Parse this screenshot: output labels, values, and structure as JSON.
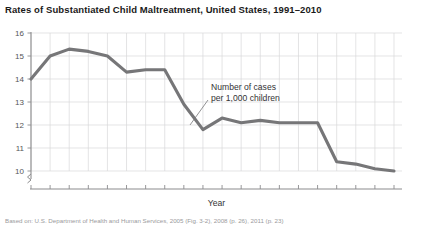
{
  "chart_data": {
    "type": "line",
    "title": "Rates of Substantiated Child Maltreatment, United States, 1991–2010",
    "xlabel": "Year",
    "ylabel": "",
    "annotation": "Number of cases\nper 1,000 children",
    "annotation_line1": "Number of cases",
    "annotation_line2": "per 1,000 children",
    "source": "Based on: U.S. Department of Health and Human Services, 2005 (Fig. 3-2), 2008 (p. 26), 2011 (p. 23)",
    "grid": true,
    "legend_position": "none",
    "axis_break_y": true,
    "axis_break_x": true,
    "xlim": [
      1991,
      2010
    ],
    "ylim": [
      10,
      16
    ],
    "yticks": [
      10,
      11,
      12,
      13,
      14,
      15,
      16
    ],
    "ytick_labels": [
      "10",
      "11",
      "12",
      "13",
      "14",
      "15",
      "16"
    ],
    "xticks": [
      1991,
      1995,
      2000,
      2005,
      2010
    ],
    "xtick_labels": [
      "1991",
      "1995",
      "2000",
      "2005",
      "2010"
    ],
    "x": [
      1991,
      1992,
      1993,
      1994,
      1995,
      1996,
      1997,
      1998,
      1999,
      2000,
      2001,
      2002,
      2003,
      2004,
      2005,
      2006,
      2007,
      2008,
      2009,
      2010
    ],
    "values": [
      14.0,
      15.0,
      15.3,
      15.2,
      15.0,
      14.3,
      14.4,
      14.4,
      12.9,
      11.8,
      12.3,
      12.1,
      12.2,
      12.1,
      12.1,
      12.1,
      10.4,
      10.3,
      10.1,
      10.0
    ],
    "series": [
      {
        "name": "Number of cases per 1,000 children",
        "color": "#767678",
        "values": [
          14.0,
          15.0,
          15.3,
          15.2,
          15.0,
          14.3,
          14.4,
          14.4,
          12.9,
          11.8,
          12.3,
          12.1,
          12.2,
          12.1,
          12.1,
          12.1,
          10.4,
          10.3,
          10.1,
          10.0
        ]
      }
    ],
    "colors": {
      "line": "#767678",
      "grid": "#d9d9da",
      "axis": "#8c8c8e",
      "text": "#333335",
      "title": "#1a1a1a",
      "background": "#ffffff"
    }
  }
}
